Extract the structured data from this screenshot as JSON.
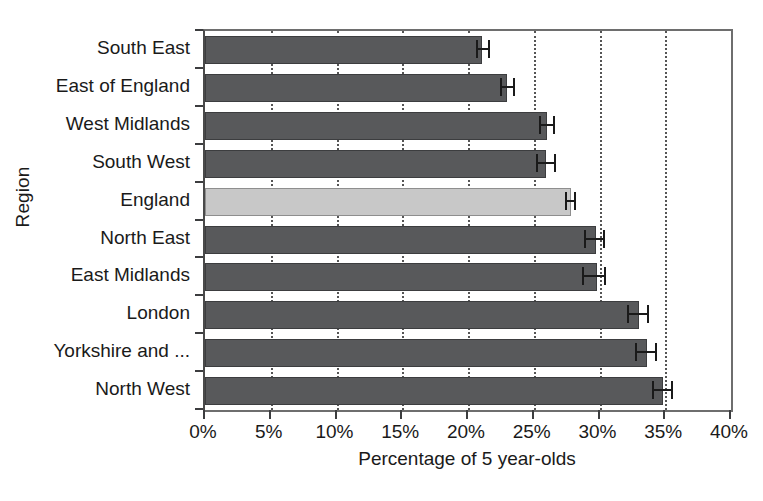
{
  "chart_data": {
    "type": "bar",
    "orientation": "horizontal",
    "title": "",
    "xlabel": "Percentage of 5 year-olds",
    "ylabel": "Region",
    "xlim": [
      0,
      40
    ],
    "xticks": [
      0,
      5,
      10,
      15,
      20,
      25,
      30,
      35,
      40
    ],
    "xtick_labels": [
      "0%",
      "5%",
      "10%",
      "15%",
      "20%",
      "25%",
      "30%",
      "35%",
      "40%"
    ],
    "grid": "vertical-dotted",
    "legend": "none",
    "categories": [
      "South East",
      "East of England",
      "West Midlands",
      "South West",
      "England",
      "North East",
      "East Midlands",
      "London",
      "Yorkshire and ...",
      "North West"
    ],
    "values": [
      21.1,
      23.0,
      26.0,
      25.9,
      27.8,
      29.7,
      29.8,
      33.0,
      33.6,
      34.8
    ],
    "error_low": [
      20.6,
      22.4,
      25.4,
      25.2,
      27.4,
      28.8,
      28.7,
      32.1,
      32.7,
      34.0
    ],
    "error_high": [
      21.7,
      23.6,
      26.6,
      26.7,
      28.2,
      30.4,
      30.5,
      33.8,
      34.4,
      35.6
    ],
    "highlight_index": 4,
    "colors": {
      "bar": "#58595b",
      "bar_highlight": "#c8c8c8",
      "bar_border": "#3c3d3f",
      "axis": "#4a4a4a",
      "gridline": "#555555",
      "text": "#1a1a1a",
      "background": "#ffffff"
    }
  },
  "axes": {
    "y_title": "Region",
    "x_title": "Percentage of 5 year-olds"
  }
}
